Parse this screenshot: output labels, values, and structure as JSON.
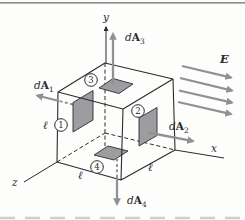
{
  "figure": {
    "colors": {
      "background": "#fdfdfc",
      "top-rule": "#8d8d8d",
      "ink": "#2b2b2b",
      "arrow-gray": "#8f9294",
      "element-fill": "#9b9da0",
      "faint-line": "#cfcfcf"
    },
    "axes": {
      "x": "x",
      "y": "y",
      "z": "z"
    },
    "field_label": "E",
    "edge_label": "ℓ",
    "area_labels": [
      {
        "d": "d",
        "A": "A",
        "sub": "1"
      },
      {
        "d": "d",
        "A": "A",
        "sub": "2"
      },
      {
        "d": "d",
        "A": "A",
        "sub": "3"
      },
      {
        "d": "d",
        "A": "A",
        "sub": "4"
      }
    ],
    "face_numbers": [
      "1",
      "2",
      "3",
      "4"
    ]
  }
}
